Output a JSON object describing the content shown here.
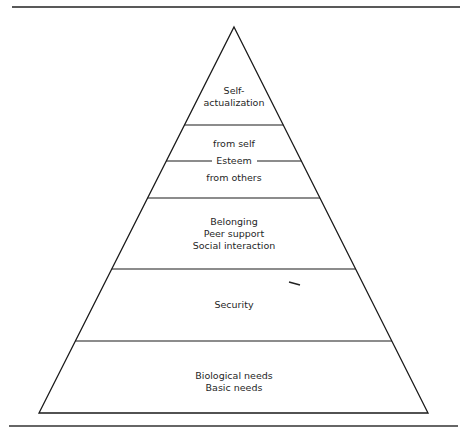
{
  "diagram": {
    "type": "pyramid",
    "colors": {
      "line": "#1a1a1a",
      "text": "#1f1f1f",
      "background": "#ffffff"
    },
    "levels": [
      {
        "id": "self-actualization",
        "lines": [
          "Self-",
          "actualization"
        ]
      },
      {
        "id": "esteem",
        "top_line": "from self",
        "divider_label": "Esteem",
        "bottom_line": "from others"
      },
      {
        "id": "belonging",
        "lines": [
          "Belonging",
          "Peer support",
          "Social interaction"
        ]
      },
      {
        "id": "security",
        "lines": [
          "Security"
        ]
      },
      {
        "id": "biological",
        "lines": [
          "Biological needs",
          "Basic needs"
        ]
      }
    ]
  }
}
